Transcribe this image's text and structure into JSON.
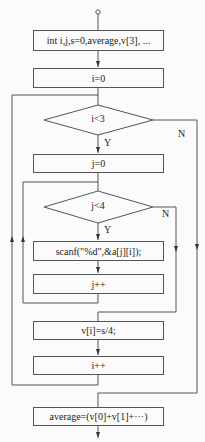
{
  "diagram": {
    "type": "flowchart",
    "nodes": {
      "declare": "int i,j,s=0,average,v[3], ...",
      "init_i": "i=0",
      "cond_i": "i<3",
      "init_j": "j=0",
      "cond_j": "j<4",
      "scan": "scanf(\"%d\",&a[j][i]);",
      "inc_j": "j++",
      "avg_col": "v[i]=s/4;",
      "inc_i": "i++",
      "average": "average=(v[0]+v[1]+···)"
    },
    "labels": {
      "cond_i_yes": "Y",
      "cond_i_no": "N",
      "cond_j_yes": "Y",
      "cond_j_no": "N"
    },
    "colors": {
      "line": "#555555",
      "text": "#222222",
      "background": "#fbfbfb"
    }
  }
}
